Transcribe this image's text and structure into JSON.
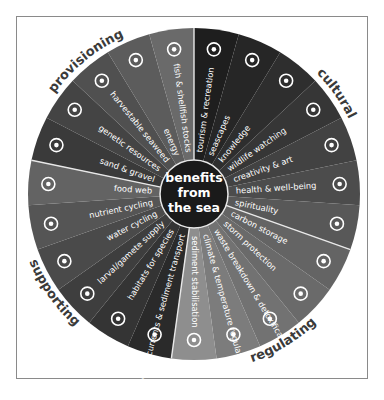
{
  "diagram": {
    "center_title_lines": [
      "benefits",
      "from",
      "the sea"
    ],
    "center_color": "#1a1a1a",
    "divider_color": "#e8e8e8",
    "categories": [
      {
        "label": "cultural",
        "start_index": 0,
        "count": 7
      },
      {
        "label": "regulating",
        "start_index": 7,
        "count": 5
      },
      {
        "label": "supporting",
        "start_index": 12,
        "count": 6
      },
      {
        "label": "provisioning",
        "start_index": 18,
        "count": 5
      }
    ],
    "segments": [
      {
        "label": "tourism & recreation",
        "icon": "ship-icon",
        "color": "#1e1e1e"
      },
      {
        "label": "seascapes",
        "icon": "sailboat-icon",
        "color": "#262626"
      },
      {
        "label": "knowledge",
        "icon": "books-icon",
        "color": "#2e2e2e"
      },
      {
        "label": "wildlife watching",
        "icon": "dolphin-icon",
        "color": "#363636"
      },
      {
        "label": "creativity & art",
        "icon": "palette-icon",
        "color": "#424242"
      },
      {
        "label": "health & well-being",
        "icon": "heart-pulse-icon",
        "color": "#4c4c4c"
      },
      {
        "label": "spirituality",
        "icon": "triskele-icon",
        "color": "#585858"
      },
      {
        "label": "carbon storage",
        "icon": "co2-capsule-icon",
        "color": "#646464"
      },
      {
        "label": "storm protection",
        "icon": "wave-icon",
        "color": "#6a6a6a"
      },
      {
        "label": "waste breakdown & detoxification",
        "icon": "recycle-icon",
        "color": "#727272"
      },
      {
        "label": "climate & temperature regulation",
        "icon": "globe-thermometer-icon",
        "color": "#7c7c7c"
      },
      {
        "label": "sediment stabilisation",
        "icon": "seagrass-roots-icon",
        "color": "#8e8e8e"
      },
      {
        "label": "water currents & sediment transport",
        "icon": "current-icon",
        "color": "#2a2a2a"
      },
      {
        "label": "habitats for species",
        "icon": "reef-icon",
        "color": "#343434"
      },
      {
        "label": "larval/gamete supply",
        "icon": "eggs-icon",
        "color": "#3e3e3e"
      },
      {
        "label": "water cycling",
        "icon": "tap-icon",
        "color": "#4a4a4a"
      },
      {
        "label": "nutrient cycling",
        "icon": "cycle-icon",
        "color": "#555555"
      },
      {
        "label": "food web",
        "icon": "fish-icon",
        "color": "#636363"
      },
      {
        "label": "sand & gravel",
        "icon": "sandcastle-icon",
        "color": "#3a3a3a"
      },
      {
        "label": "genetic resources",
        "icon": "dna-icon",
        "color": "#444444"
      },
      {
        "label": "harvestable seaweed",
        "icon": "seaweed-icon",
        "color": "#505050"
      },
      {
        "label": "energy",
        "icon": "lightning-icon",
        "color": "#5c5c5c"
      },
      {
        "label": "fish & shellfish stocks",
        "icon": "shell-icon",
        "color": "#6a6a6a"
      }
    ]
  }
}
